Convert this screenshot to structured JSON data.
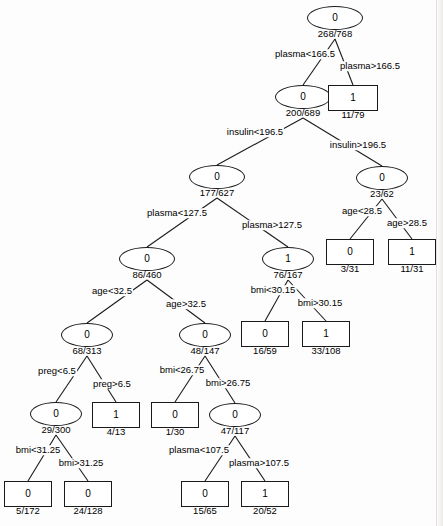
{
  "figure": {
    "type": "decision-tree",
    "title": "",
    "width": 443,
    "height": 526,
    "background_color": "#fdfdfd",
    "stroke_color": "#1a1a1a",
    "text_color": "#000000"
  },
  "chart_data": {
    "type": "diagram",
    "title": "",
    "nodes": [
      {
        "id": "n0",
        "label": "0",
        "counts": "268/768",
        "shape": "ellipse",
        "x": 335,
        "y": 18,
        "w": 56,
        "h": 24
      },
      {
        "id": "n1",
        "label": "0",
        "counts": "200/689",
        "shape": "ellipse",
        "x": 303,
        "y": 97,
        "w": 56,
        "h": 24
      },
      {
        "id": "n2",
        "label": "1",
        "counts": "11/79",
        "shape": "rect",
        "x": 353,
        "y": 98,
        "w": 50,
        "h": 26
      },
      {
        "id": "n3",
        "label": "0",
        "counts": "177/627",
        "shape": "ellipse",
        "x": 217,
        "y": 177,
        "w": 56,
        "h": 24
      },
      {
        "id": "n4",
        "label": "0",
        "counts": "23/62",
        "shape": "ellipse",
        "x": 382,
        "y": 178,
        "w": 52,
        "h": 24
      },
      {
        "id": "n5",
        "label": "0",
        "counts": "86/460",
        "shape": "ellipse",
        "x": 147,
        "y": 259,
        "w": 56,
        "h": 24
      },
      {
        "id": "n6",
        "label": "1",
        "counts": "76/167",
        "shape": "ellipse",
        "x": 288,
        "y": 259,
        "w": 52,
        "h": 24
      },
      {
        "id": "n7",
        "label": "0",
        "counts": "3/31",
        "shape": "rect",
        "x": 350,
        "y": 252,
        "w": 48,
        "h": 26
      },
      {
        "id": "n8",
        "label": "1",
        "counts": "11/31",
        "shape": "rect",
        "x": 412,
        "y": 252,
        "w": 48,
        "h": 26
      },
      {
        "id": "n9",
        "label": "0",
        "counts": "68/313",
        "shape": "ellipse",
        "x": 87,
        "y": 335,
        "w": 52,
        "h": 24
      },
      {
        "id": "n10",
        "label": "0",
        "counts": "48/147",
        "shape": "ellipse",
        "x": 205,
        "y": 335,
        "w": 52,
        "h": 24
      },
      {
        "id": "n11",
        "label": "0",
        "counts": "16/59",
        "shape": "rect",
        "x": 265,
        "y": 334,
        "w": 48,
        "h": 26
      },
      {
        "id": "n12",
        "label": "1",
        "counts": "33/108",
        "shape": "rect",
        "x": 326,
        "y": 334,
        "w": 48,
        "h": 26
      },
      {
        "id": "n13",
        "label": "0",
        "counts": "29/300",
        "shape": "ellipse",
        "x": 56,
        "y": 414,
        "w": 52,
        "h": 24
      },
      {
        "id": "n14",
        "label": "1",
        "counts": "4/13",
        "shape": "rect",
        "x": 116,
        "y": 415,
        "w": 48,
        "h": 26
      },
      {
        "id": "n15",
        "label": "0",
        "counts": "1/30",
        "shape": "rect",
        "x": 175,
        "y": 415,
        "w": 48,
        "h": 26
      },
      {
        "id": "n16",
        "label": "0",
        "counts": "47/117",
        "shape": "ellipse",
        "x": 235,
        "y": 415,
        "w": 52,
        "h": 24
      },
      {
        "id": "n17",
        "label": "0",
        "counts": "5/172",
        "shape": "rect",
        "x": 28,
        "y": 494,
        "w": 48,
        "h": 26
      },
      {
        "id": "n18",
        "label": "0",
        "counts": "24/128",
        "shape": "rect",
        "x": 88,
        "y": 494,
        "w": 48,
        "h": 26
      },
      {
        "id": "n19",
        "label": "0",
        "counts": "15/65",
        "shape": "rect",
        "x": 205,
        "y": 494,
        "w": 48,
        "h": 26
      },
      {
        "id": "n20",
        "label": "1",
        "counts": "20/52",
        "shape": "rect",
        "x": 265,
        "y": 494,
        "w": 48,
        "h": 26
      }
    ],
    "edges": [
      {
        "from": "n0",
        "to": "n1",
        "label": "plasma<166.5",
        "lx": 305,
        "ly": 54
      },
      {
        "from": "n0",
        "to": "n2",
        "label": "plasma>166.5",
        "lx": 370,
        "ly": 66
      },
      {
        "from": "n1",
        "to": "n3",
        "label": "insulin<196.5",
        "lx": 255,
        "ly": 132
      },
      {
        "from": "n1",
        "to": "n4",
        "label": "insulin>196.5",
        "lx": 358,
        "ly": 145
      },
      {
        "from": "n3",
        "to": "n5",
        "label": "plasma<127.5",
        "lx": 177,
        "ly": 213
      },
      {
        "from": "n3",
        "to": "n6",
        "label": "plasma>127.5",
        "lx": 272,
        "ly": 225
      },
      {
        "from": "n4",
        "to": "n7",
        "label": "age<28.5",
        "lx": 362,
        "ly": 211
      },
      {
        "from": "n4",
        "to": "n8",
        "label": "age>28.5",
        "lx": 407,
        "ly": 223
      },
      {
        "from": "n5",
        "to": "n9",
        "label": "age<32.5",
        "lx": 112,
        "ly": 291
      },
      {
        "from": "n5",
        "to": "n10",
        "label": "age>32.5",
        "lx": 186,
        "ly": 304
      },
      {
        "from": "n6",
        "to": "n11",
        "label": "bmi<30.15",
        "lx": 273,
        "ly": 290
      },
      {
        "from": "n6",
        "to": "n12",
        "label": "bmi>30.15",
        "lx": 320,
        "ly": 303
      },
      {
        "from": "n9",
        "to": "n13",
        "label": "preg<6.5",
        "lx": 57,
        "ly": 371
      },
      {
        "from": "n9",
        "to": "n14",
        "label": "preg>6.5",
        "lx": 112,
        "ly": 384
      },
      {
        "from": "n10",
        "to": "n15",
        "label": "bmi<26.75",
        "lx": 182,
        "ly": 370
      },
      {
        "from": "n10",
        "to": "n16",
        "label": "bmi>26.75",
        "lx": 228,
        "ly": 383
      },
      {
        "from": "n13",
        "to": "n17",
        "label": "bmi<31.25",
        "lx": 38,
        "ly": 450
      },
      {
        "from": "n13",
        "to": "n18",
        "label": "bmi>31.25",
        "lx": 81,
        "ly": 463
      },
      {
        "from": "n16",
        "to": "n19",
        "label": "plasma<107.5",
        "lx": 199,
        "ly": 450
      },
      {
        "from": "n16",
        "to": "n20",
        "label": "plasma>107.5",
        "lx": 259,
        "ly": 463
      }
    ]
  }
}
